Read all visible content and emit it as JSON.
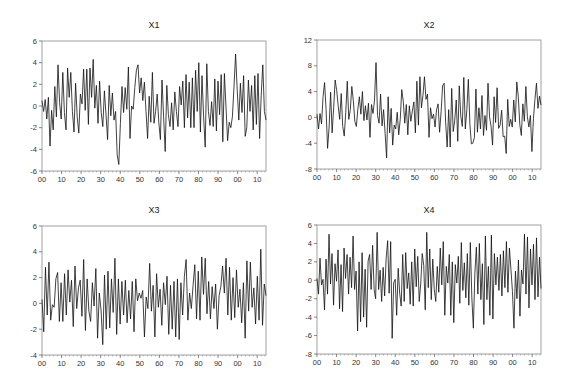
{
  "chart_data": [
    {
      "type": "line",
      "title": "X1",
      "xlabel": "",
      "ylabel": "",
      "ylim": [
        -6,
        6
      ],
      "yticks": [
        -6,
        -4,
        -2,
        0,
        2,
        4,
        6
      ],
      "xtick_labels": [
        "00",
        "10",
        "20",
        "30",
        "40",
        "50",
        "60",
        "70",
        "80",
        "90",
        "00",
        "10"
      ],
      "grid": false,
      "frame": {
        "x0": 42,
        "y0": 41,
        "x1": 266,
        "y1": 171
      },
      "values": [
        0.5,
        -0.5,
        0.6,
        -1.2,
        0.8,
        -3.7,
        -0.4,
        -2.2,
        1.8,
        -1.0,
        3.8,
        0.3,
        -1.2,
        3.1,
        -0.6,
        -2.2,
        3.5,
        0.8,
        3.1,
        -0.5,
        -2.4,
        2.1,
        -1.0,
        -2.5,
        1.1,
        0.2,
        3.4,
        -0.4,
        3.4,
        -1.7,
        3.5,
        0.8,
        4.3,
        -0.2,
        1.9,
        -1.6,
        2.3,
        -0.6,
        -1.9,
        1.4,
        -0.8,
        -3.1,
        1.9,
        -0.9,
        1.2,
        -1.3,
        -0.5,
        -4.5,
        -5.4,
        -1.6,
        1.8,
        -0.6,
        1.7,
        -0.3,
        3.6,
        -3.0,
        0.0,
        -0.3,
        1.7,
        3.3,
        3.8,
        1.2,
        2.6,
        0.5,
        2.2,
        -0.5,
        -3.0,
        0.9,
        -1.5,
        3.1,
        -1.6,
        -0.5,
        1.1,
        -1.5,
        -3.1,
        2.4,
        -1.0,
        -4.2,
        1.9,
        -0.8,
        -1.9,
        0.3,
        -2.2,
        1.3,
        -0.5,
        -1.9,
        1.8,
        0.1,
        2.3,
        -2.0,
        2.9,
        -1.1,
        2.2,
        -2.0,
        2.6,
        -2.0,
        3.3,
        -0.5,
        4.0,
        -2.4,
        2.8,
        -1.0,
        -3.8,
        3.9,
        -0.5,
        -1.8,
        0.4,
        -1.9,
        2.5,
        -2.3,
        2.3,
        -0.8,
        2.9,
        -3.3,
        3.0,
        -0.1,
        -3.2,
        -1.5,
        -2.0,
        -1.0,
        1.8,
        4.8,
        1.5,
        -1.3,
        2.1,
        -0.6,
        2.8,
        -2.8,
        -2.0,
        2.4,
        -0.5,
        1.9,
        -2.2,
        2.8,
        -1.7,
        3.0,
        -3.0,
        1.0,
        3.8,
        -0.5,
        -1.3
      ]
    },
    {
      "type": "line",
      "title": "X2",
      "xlabel": "",
      "ylabel": "",
      "ylim": [
        -8,
        12
      ],
      "yticks": [
        -8,
        -4,
        0,
        4,
        8,
        12
      ],
      "xtick_labels": [
        "00",
        "10",
        "20",
        "30",
        "40",
        "50",
        "60",
        "70",
        "80",
        "90",
        "00",
        "10"
      ],
      "grid": false,
      "frame": {
        "x0": 317,
        "y0": 40,
        "x1": 541,
        "y1": 169
      },
      "values": [
        0.5,
        -1.8,
        0.6,
        -1.0,
        3.2,
        5.4,
        1.2,
        -4.8,
        -1.5,
        3.9,
        -2.4,
        1.5,
        5.8,
        4.2,
        1.8,
        -0.3,
        3.7,
        -1.4,
        -2.9,
        0.8,
        5.6,
        -0.3,
        1.2,
        4.8,
        2.6,
        -0.6,
        -1.4,
        1.3,
        3.2,
        0.5,
        4.0,
        -0.5,
        1.8,
        -0.4,
        2.2,
        -3.1,
        2.0,
        0.6,
        2.7,
        8.5,
        0.3,
        -0.9,
        3.6,
        -1.3,
        1.2,
        -2.5,
        -6.3,
        3.2,
        -2.4,
        1.4,
        -4.3,
        -1.2,
        -1.8,
        0.8,
        -2.7,
        -0.3,
        4.3,
        2.5,
        -0.9,
        2.0,
        -2.7,
        1.8,
        -0.6,
        1.0,
        2.4,
        -2.4,
        5.6,
        -1.2,
        6.3,
        1.5,
        3.4,
        6.3,
        2.8,
        3.6,
        -3.1,
        1.5,
        -0.2,
        0.5,
        -1.5,
        1.2,
        2.1,
        -2.3,
        0.9,
        4.9,
        5.3,
        -0.8,
        -4.6,
        1.2,
        -4.6,
        4.5,
        -2.2,
        -0.5,
        2.7,
        -3.7,
        4.9,
        0.2,
        -1.4,
        6.2,
        -1.8,
        1.2,
        5.9,
        -1.0,
        -4.1,
        -4.0,
        -3.1,
        4.4,
        -2.3,
        1.5,
        -1.8,
        3.4,
        -2.8,
        0.3,
        -2.0,
        5.3,
        0.1,
        -1.4,
        -4.3,
        3.2,
        -0.8,
        4.6,
        -1.7,
        -1.2,
        1.1,
        -3.0,
        -2.9,
        -5.6,
        2.8,
        -1.4,
        -0.3,
        -1.5,
        2.7,
        -0.7,
        5.5,
        3.2,
        -1.1,
        -2.8,
        2.1,
        -0.6,
        4.8,
        0.1,
        -1.5,
        0.3,
        -5.3,
        -0.2,
        2.8,
        5.3,
        1.4,
        3.3,
        1.9
      ]
    },
    {
      "type": "line",
      "title": "X3",
      "xlabel": "",
      "ylabel": "",
      "ylim": [
        -4,
        6
      ],
      "yticks": [
        -4,
        -2,
        0,
        2,
        4,
        6
      ],
      "xtick_labels": [
        "00",
        "10",
        "20",
        "30",
        "40",
        "50",
        "60",
        "70",
        "80",
        "90",
        "00",
        "10"
      ],
      "grid": false,
      "frame": {
        "x0": 42,
        "y0": 226,
        "x1": 266,
        "y1": 355
      },
      "values": [
        0.3,
        -2.2,
        2.8,
        -0.9,
        3.2,
        -1.3,
        -0.1,
        -0.3,
        1.9,
        2.4,
        -1.4,
        1.6,
        -1.4,
        2.3,
        -0.9,
        2.6,
        0.1,
        1.8,
        -1.8,
        2.9,
        -0.4,
        1.2,
        1.8,
        -1.0,
        3.4,
        -2.1,
        1.9,
        -0.6,
        -1.4,
        1.6,
        -0.2,
        2.7,
        -2.7,
        0.8,
        -0.5,
        -3.2,
        2.2,
        -2.0,
        2.5,
        -1.9,
        1.9,
        -0.7,
        3.5,
        -2.4,
        1.9,
        -1.6,
        1.7,
        -0.9,
        1.8,
        -1.5,
        1.0,
        -1.2,
        1.7,
        -2.2,
        1.9,
        0.2,
        0.8,
        0.4,
        1.0,
        -2.6,
        0.5,
        -0.4,
        3.1,
        -0.6,
        1.4,
        -2.6,
        2.3,
        -0.3,
        1.1,
        -1.7,
        1.6,
        -0.1,
        2.1,
        -2.4,
        1.4,
        -2.0,
        1.7,
        -2.6,
        1.9,
        -2.8,
        1.6,
        -0.9,
        2.1,
        3.4,
        -1.3,
        0.8,
        -0.4,
        1.4,
        3.0,
        -1.2,
        2.5,
        -1.3,
        3.6,
        0.7,
        3.5,
        -0.8,
        1.7,
        -1.2,
        1.3,
        -0.4,
        1.5,
        -2.0,
        0.6,
        1.3,
        2.9,
        0.8,
        3.5,
        -0.9,
        2.8,
        -1.3,
        2.0,
        -1.1,
        2.6,
        -0.3,
        1.1,
        -1.5,
        1.6,
        -2.7,
        3.3,
        -0.6,
        3.2,
        -0.3,
        1.2,
        -1.6,
        2.1,
        -1.3,
        4.2,
        -1.7,
        1.5,
        0.6
      ]
    },
    {
      "type": "line",
      "title": "X4",
      "xlabel": "",
      "ylabel": "",
      "ylim": [
        -8,
        6
      ],
      "yticks": [
        -8,
        -6,
        -4,
        -2,
        0,
        2,
        4,
        6
      ],
      "xtick_labels": [
        "00",
        "10",
        "20",
        "30",
        "40",
        "50",
        "60",
        "70",
        "80",
        "90",
        "00",
        "10"
      ],
      "grid": false,
      "frame": {
        "x0": 317,
        "y0": 225,
        "x1": 541,
        "y1": 354
      },
      "values": [
        0.2,
        -1.5,
        2.4,
        -0.5,
        0.1,
        -3.2,
        2.3,
        -1.5,
        5.0,
        -0.4,
        2.9,
        -2.7,
        1.8,
        -0.1,
        3.3,
        -3.1,
        1.7,
        -3.4,
        3.5,
        0.2,
        2.8,
        -1.5,
        2.5,
        -0.8,
        4.8,
        -1.0,
        1.0,
        -5.5,
        2.0,
        -4.5,
        3.0,
        -4.0,
        1.2,
        -5.1,
        2.1,
        2.8,
        -1.0,
        3.8,
        -1.0,
        -2.0,
        5.2,
        -1.0,
        1.1,
        -2.3,
        1.4,
        -1.7,
        2.4,
        4.3,
        -1.4,
        4.2,
        -6.3,
        -0.3,
        0.1,
        -3.8,
        1.3,
        -1.4,
        -2.8,
        2.8,
        -2.3,
        3.0,
        -0.9,
        0.8,
        -2.6,
        2.0,
        -2.8,
        3.4,
        -0.7,
        2.6,
        -2.3,
        -0.4,
        2.9,
        1.6,
        -3.2,
        5.2,
        -0.8,
        3.4,
        -2.1,
        2.3,
        -1.0,
        -2.3,
        1.5,
        -1.3,
        3.5,
        -0.5,
        4.2,
        -3.8,
        1.5,
        -0.3,
        2.8,
        -3.8,
        2.0,
        -4.6,
        1.7,
        -0.3,
        2.6,
        -2.5,
        4.1,
        -1.1,
        1.9,
        -1.9,
        2.9,
        -2.7,
        4.1,
        -1.9,
        -5.2,
        0.7,
        3.6,
        -1.5,
        4.0,
        -2.1,
        1.8,
        -4.8,
        4.8,
        -2.1,
        1.5,
        -3.8,
        4.9,
        -4.2,
        2.9,
        -0.5,
        2.5,
        -1.1,
        2.8,
        -1.7,
        3.2,
        -0.8,
        4.2,
        -1.3,
        3.5,
        1.2,
        -1.2,
        -5.2,
        1.0,
        -2.0,
        2.2,
        -3.9,
        1.1,
        -0.4,
        5.0,
        -1.5,
        4.7,
        -3.0,
        3.4,
        -0.5,
        3.9,
        -2.1,
        4.6,
        -1.8,
        2.5,
        -0.9
      ]
    }
  ],
  "panels": [
    {
      "title": "X1"
    },
    {
      "title": "X2"
    },
    {
      "title": "X3"
    },
    {
      "title": "X4"
    }
  ]
}
